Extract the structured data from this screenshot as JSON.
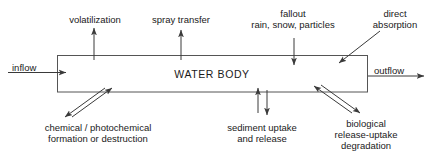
{
  "diagram": {
    "title": "WATER BODY",
    "box": {
      "x": 57,
      "y": 55,
      "width": 311,
      "height": 37,
      "stroke": "#555555"
    },
    "labels": {
      "inflow": "inflow",
      "outflow": "outflow",
      "volatilization": "volatilization",
      "spray_transfer": "spray transfer",
      "fallout_line1": "fallout",
      "fallout_line2": "rain, snow, particles",
      "direct_absorption_line1": "direct",
      "direct_absorption_line2": "absorption",
      "chemical_line1": "chemical / photochemical",
      "chemical_line2": "formation or destruction",
      "sediment_line1": "sediment uptake",
      "sediment_line2": "and release",
      "biological_line1": "biological",
      "biological_line2": "release-uptake",
      "biological_line3": "degradation"
    },
    "flows": [
      {
        "name": "inflow-arrow",
        "direction": "into-box",
        "orientation": "horizontal-right"
      },
      {
        "name": "outflow-arrow",
        "direction": "out-of-box",
        "orientation": "horizontal-right"
      },
      {
        "name": "volatilization-arrow",
        "direction": "out-of-box",
        "orientation": "vertical-up"
      },
      {
        "name": "spray-transfer-arrow",
        "direction": "out-of-box",
        "orientation": "vertical-up"
      },
      {
        "name": "fallout-arrow",
        "direction": "into-box",
        "orientation": "vertical-down"
      },
      {
        "name": "direct-absorption-arrow",
        "direction": "into-box",
        "orientation": "diagonal-down-left"
      },
      {
        "name": "chemical-arrow-in",
        "direction": "into-box",
        "orientation": "diagonal-up-right"
      },
      {
        "name": "chemical-arrow-out",
        "direction": "out-of-box",
        "orientation": "diagonal-down-left"
      },
      {
        "name": "sediment-arrow-in",
        "direction": "into-box",
        "orientation": "vertical-up"
      },
      {
        "name": "sediment-arrow-out",
        "direction": "out-of-box",
        "orientation": "vertical-down"
      },
      {
        "name": "biological-arrow-in",
        "direction": "into-box",
        "orientation": "diagonal-up-left"
      },
      {
        "name": "biological-arrow-out",
        "direction": "out-of-box",
        "orientation": "diagonal-down-right"
      }
    ],
    "colors": {
      "line": "#555555",
      "arrow": "#3a3a3a",
      "text": "#1a1a1a",
      "background": "#ffffff"
    }
  }
}
